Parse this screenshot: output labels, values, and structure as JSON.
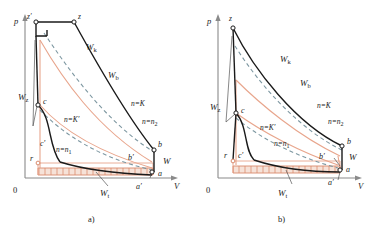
{
  "figure": {
    "type": "thermodynamic-pv-indicator-diagram",
    "panel_count": 2,
    "colors": {
      "ink": "#1a1a1a",
      "axis": "#8a8a8a",
      "salmon": "#e8a58c",
      "salmon_dark": "#d98b6e",
      "dashed_teal": "#7d97a1",
      "hatch_fill": "#f6e2d8"
    }
  },
  "panels": [
    {
      "id": "a",
      "caption": "a)",
      "axis": {
        "y_label": "p",
        "x_label": "V",
        "origin_label": "0"
      },
      "state_points": [
        {
          "name": "z-prime",
          "label": "z′"
        },
        {
          "name": "z",
          "label": "z"
        },
        {
          "name": "c",
          "label": "c"
        },
        {
          "name": "c-prime",
          "label": "c′"
        },
        {
          "name": "b",
          "label": "b"
        },
        {
          "name": "b-prime",
          "label": "b′"
        },
        {
          "name": "a",
          "label": "a"
        },
        {
          "name": "a-prime",
          "label": "a′"
        },
        {
          "name": "r",
          "label": "r"
        }
      ],
      "work_labels": [
        {
          "name": "Wk",
          "base": "W",
          "sub": "k"
        },
        {
          "name": "Wb",
          "base": "W",
          "sub": "b"
        },
        {
          "name": "Wz",
          "base": "W",
          "sub": "z"
        },
        {
          "name": "Wt",
          "base": "W",
          "sub": "t"
        },
        {
          "name": "W",
          "base": "W",
          "sub": ""
        }
      ],
      "polytropic_labels": [
        {
          "name": "n-equals-K",
          "text": "n=K"
        },
        {
          "name": "n-equals-Kp",
          "text": "n=K′"
        },
        {
          "name": "n-equals-n1",
          "base": "n=n",
          "sub": "1"
        },
        {
          "name": "n-equals-n2",
          "base": "n=n",
          "sub": "2"
        }
      ]
    },
    {
      "id": "b",
      "caption": "b)",
      "axis": {
        "y_label": "p",
        "x_label": "V",
        "origin_label": "0"
      },
      "state_points": [
        {
          "name": "z",
          "label": "z"
        },
        {
          "name": "c",
          "label": "c"
        },
        {
          "name": "c-prime",
          "label": "c′"
        },
        {
          "name": "b",
          "label": "b"
        },
        {
          "name": "b-prime",
          "label": "b′"
        },
        {
          "name": "a",
          "label": "a"
        },
        {
          "name": "a-prime",
          "label": "a′"
        },
        {
          "name": "r",
          "label": "r"
        }
      ],
      "work_labels": [
        {
          "name": "Wk",
          "base": "W",
          "sub": "k"
        },
        {
          "name": "Wb",
          "base": "W",
          "sub": "b"
        },
        {
          "name": "Wz",
          "base": "W",
          "sub": "z"
        },
        {
          "name": "Wt",
          "base": "W",
          "sub": "t"
        },
        {
          "name": "W",
          "base": "W",
          "sub": ""
        }
      ],
      "polytropic_labels": [
        {
          "name": "n-equals-K",
          "text": "n=K"
        },
        {
          "name": "n-equals-Kp",
          "text": "n=K′"
        },
        {
          "name": "n-equals-n1",
          "base": "n=n",
          "sub": "1"
        },
        {
          "name": "n-equals-n2",
          "base": "n=n",
          "sub": "2"
        }
      ]
    }
  ]
}
